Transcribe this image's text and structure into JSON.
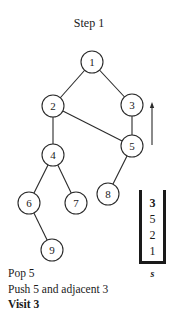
{
  "title": "Step 1",
  "graph": {
    "nodes": [
      {
        "id": "1",
        "label": "1",
        "x": 92,
        "y": 62
      },
      {
        "id": "2",
        "label": "2",
        "x": 53,
        "y": 106
      },
      {
        "id": "3",
        "label": "3",
        "x": 132,
        "y": 105
      },
      {
        "id": "4",
        "label": "4",
        "x": 53,
        "y": 155
      },
      {
        "id": "5",
        "label": "5",
        "x": 132,
        "y": 146
      },
      {
        "id": "6",
        "label": "6",
        "x": 29,
        "y": 203
      },
      {
        "id": "7",
        "label": "7",
        "x": 76,
        "y": 203
      },
      {
        "id": "8",
        "label": "8",
        "x": 108,
        "y": 194
      },
      {
        "id": "9",
        "label": "9",
        "x": 52,
        "y": 250
      }
    ],
    "edges": [
      [
        "1",
        "2"
      ],
      [
        "1",
        "3"
      ],
      [
        "2",
        "4"
      ],
      [
        "2",
        "5"
      ],
      [
        "3",
        "5"
      ],
      [
        "4",
        "6"
      ],
      [
        "4",
        "7"
      ],
      [
        "5",
        "8"
      ],
      [
        "6",
        "9"
      ]
    ],
    "traversal_arrow": {
      "from": "5",
      "to": "3",
      "direction": "up"
    }
  },
  "stack": {
    "label": "s",
    "items_top_to_bottom": [
      "3",
      "5",
      "2",
      "1"
    ]
  },
  "steps": {
    "line1": "Pop 5",
    "line2": "Push 5 and adjacent 3",
    "line3": "Visit 3"
  }
}
